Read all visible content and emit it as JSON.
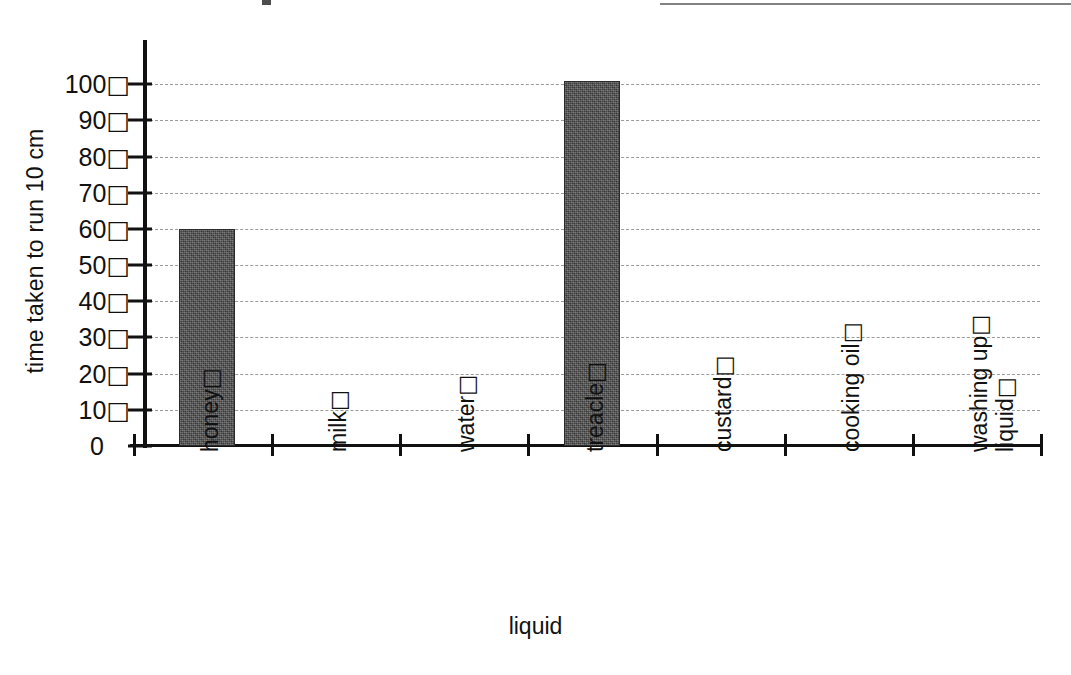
{
  "chart_data": {
    "type": "bar",
    "title": "",
    "xlabel": "liquid",
    "ylabel": "time taken to run 10 cm",
    "categories": [
      "honey",
      "milk",
      "water",
      "treacle",
      "custard",
      "cooking oil",
      "washing up liquid"
    ],
    "category_label_lines": [
      [
        "honey"
      ],
      [
        "milk"
      ],
      [
        "water"
      ],
      [
        "treacle"
      ],
      [
        "custard"
      ],
      [
        "cooking oil"
      ],
      [
        "washing up",
        "liquid"
      ]
    ],
    "values": [
      60,
      0,
      0,
      101,
      0,
      0,
      0
    ],
    "ylim": [
      0,
      110
    ],
    "yticks": [
      0,
      10,
      20,
      30,
      40,
      50,
      60,
      70,
      80,
      90,
      100
    ],
    "ytick_labels": [
      "0",
      "10",
      "20",
      "30",
      "40",
      "50",
      "60",
      "70",
      "80",
      "90",
      "100"
    ],
    "grid": true,
    "gridline_style": "dashed",
    "legend": "none",
    "bar_color": "#4a4a4a",
    "axis_color": "#111111",
    "gridline_color": "#9a9a9a",
    "tofu_glyph": "□",
    "tick_label_suffix_glyph": "□"
  },
  "axes": {
    "y_title": "time taken to run 10 cm",
    "x_title": "liquid"
  }
}
